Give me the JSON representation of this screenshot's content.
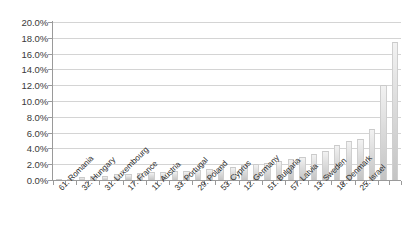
{
  "chart_data": {
    "type": "bar",
    "title": "",
    "subtitle": "",
    "xlabel": "",
    "ylabel": "",
    "ylim": [
      0,
      20
    ],
    "ytick_values": [
      0,
      2,
      4,
      6,
      8,
      10,
      12,
      14,
      16,
      18,
      20
    ],
    "ytick_labels": [
      "0.0%",
      "2.0%",
      "4.0%",
      "6.0%",
      "8.0%",
      "10.0%",
      "12.0%",
      "14.0%",
      "16.0%",
      "18.0%",
      "20.0%"
    ],
    "grid": true,
    "legend": false,
    "legend_position": "none",
    "bar_color": "#d9d9d9",
    "axis_color": "#9a9a9a",
    "gridline_color": "#d4d4d4",
    "categories": [
      "61. Romania",
      "",
      "32. Hungary",
      "",
      "31. Luxembourg",
      "",
      "17. France",
      "",
      "11. Austria",
      "",
      "33. Portugal",
      "",
      "29. Poland",
      "",
      "53. Cyprus",
      "",
      "12. Germany",
      "",
      "51. Bulgaria",
      "",
      "57. Latvia",
      "",
      "13. Sweden",
      "",
      "18. Denmark",
      "",
      "25. Israel",
      "",
      "",
      ""
    ],
    "visible_tick_labels": [
      "61. Romania",
      "32. Hungary",
      "31. Luxembourg",
      "17. France",
      "11. Austria",
      "33. Portugal",
      "29. Poland",
      "53. Cyprus",
      "12. Germany",
      "51. Bulgaria",
      "57. Latvia",
      "13. Sweden",
      "18. Denmark",
      "25. Israel"
    ],
    "values": [
      0.05,
      0.15,
      0.35,
      0.45,
      0.55,
      0.7,
      0.8,
      0.9,
      1.0,
      1.05,
      1.15,
      1.2,
      1.3,
      1.45,
      1.6,
      1.7,
      1.85,
      2.0,
      2.2,
      2.4,
      2.6,
      2.9,
      3.3,
      3.7,
      4.4,
      5.0,
      5.2,
      6.4,
      12.0,
      17.5
    ]
  }
}
